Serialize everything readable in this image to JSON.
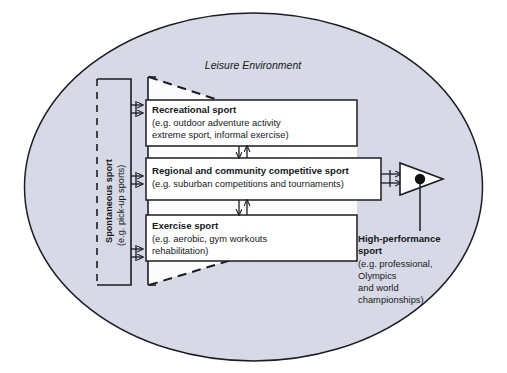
{
  "diagram": {
    "title": "Leisure Environment",
    "environment_label": "Leisure Environment",
    "colors": {
      "ellipse_fill": "#d7dae6",
      "ellipse_stroke": "#1b1d22",
      "box_fill": "#ffffff",
      "box_stroke": "#1b1d22",
      "line": "#1b1d22",
      "dashed_line": "#1b1d22",
      "text": "#16181c",
      "page_background": "#ffffff",
      "node_dot": "#111111"
    },
    "spontaneous": {
      "heading": "Spontaneous sport",
      "example": "(e.g. pick-up sports)",
      "orientation": "vertical"
    },
    "boxes": [
      {
        "id": "recreational-sport",
        "heading": "Recreational sport",
        "lines": [
          "(e.g. outdoor adventure activity",
          "extreme sport, informal exercise)"
        ]
      },
      {
        "id": "regional-community-competitive-sport",
        "heading": "Regional and community competitive sport",
        "lines": [
          "(e.g. suburban competitions and tournaments)"
        ]
      },
      {
        "id": "exercise-sport",
        "heading": "Exercise sport",
        "lines": [
          "(e.g. aerobic, gym workouts",
          "rehabilitation)"
        ]
      }
    ],
    "high_performance": {
      "heading_line_1": "High-performance",
      "heading_line_2": "sport",
      "lines": [
        "(e.g. professional,",
        "Olympics",
        "and world",
        "championships)"
      ]
    },
    "icons": {
      "funnel_arrowhead": "triangle-arrowhead-icon",
      "node_dot": "filled-circle-node-icon"
    }
  }
}
